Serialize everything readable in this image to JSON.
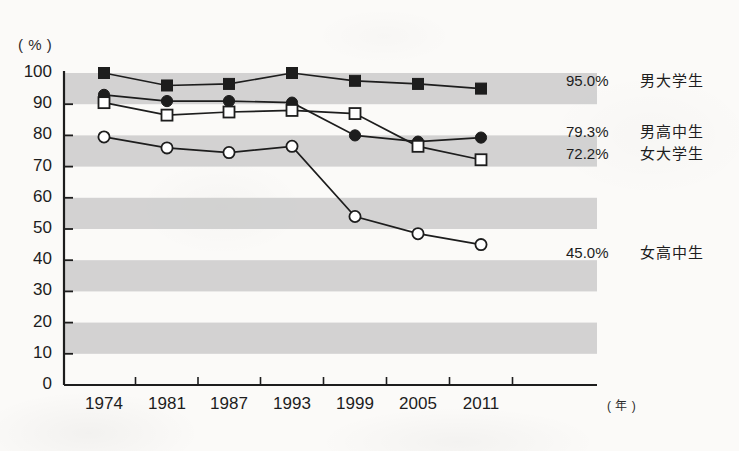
{
  "chart_data": {
    "type": "line",
    "title": "",
    "subtitle": "",
    "xlabel": "年",
    "ylabel": "%",
    "ylim": [
      0,
      100
    ],
    "yticks": [
      0,
      10,
      20,
      30,
      40,
      50,
      60,
      70,
      80,
      90,
      100
    ],
    "grid": "horizontal alternating gray bands (10-20, 30-40, 50-60, 70-80, 90-100)",
    "legend_position": "right, inline at series end",
    "categories": [
      "1974",
      "1981",
      "1987",
      "1993",
      "1999",
      "2005",
      "2011"
    ],
    "x": [
      1974,
      1981,
      1987,
      1993,
      1999,
      2005,
      2011
    ],
    "series": [
      {
        "name": "男大学生",
        "marker": "filled-square",
        "end_value_label": "95.0%",
        "values": [
          100.0,
          96.0,
          96.5,
          100.0,
          97.5,
          96.5,
          95.0
        ]
      },
      {
        "name": "男高中生",
        "marker": "filled-circle",
        "end_value_label": "79.3%",
        "values": [
          93.0,
          91.0,
          91.0,
          90.5,
          80.0,
          78.0,
          79.3
        ]
      },
      {
        "name": "女大学生",
        "marker": "open-square",
        "end_value_label": "72.2%",
        "values": [
          90.5,
          86.5,
          87.5,
          88.0,
          87.0,
          76.5,
          72.2
        ]
      },
      {
        "name": "女高中生",
        "marker": "open-circle",
        "end_value_label": "45.0%",
        "values": [
          79.5,
          76.0,
          74.5,
          76.5,
          54.0,
          48.5,
          45.0
        ]
      }
    ]
  },
  "axes": {
    "y_unit": "( % )",
    "x_unit": "( 年 )"
  },
  "colors": {
    "ink": "#1d1d1d",
    "band": "#c9c9c9",
    "background": "#fbfaf8"
  },
  "annotations": [
    {
      "text": "95.0%",
      "series": "男大学生"
    },
    {
      "text": "79.3%",
      "series": "男高中生"
    },
    {
      "text": "72.2%",
      "series": "女大学生"
    },
    {
      "text": "45.0%",
      "series": "女高中生"
    }
  ]
}
